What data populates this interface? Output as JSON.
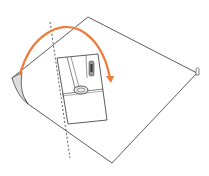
{
  "diagram": {
    "type": "fold-instruction",
    "colors": {
      "background": "#ffffff",
      "outline": "#333333",
      "arrow": "#f07a3a",
      "flap_fill": "#dddddd",
      "fold_line": "#333333"
    },
    "sheet": {
      "points": [
        [
          88,
          17
        ],
        [
          197,
          73
        ],
        [
          112,
          163
        ],
        [
          16,
          95
        ],
        [
          12,
          78
        ]
      ]
    },
    "inset_panel": {
      "points": [
        [
          57,
          58
        ],
        [
          98,
          54
        ],
        [
          107,
          120
        ],
        [
          68,
          124
        ]
      ]
    },
    "fold_line": {
      "style": "dashed",
      "from": [
        50,
        22
      ],
      "to": [
        70,
        158
      ]
    },
    "arrow": {
      "direction": "fold-over-left-to-right",
      "path": "M20 75 C 30 35, 60 20, 80 30 C 95 38, 105 52, 110 78"
    },
    "labels": []
  }
}
